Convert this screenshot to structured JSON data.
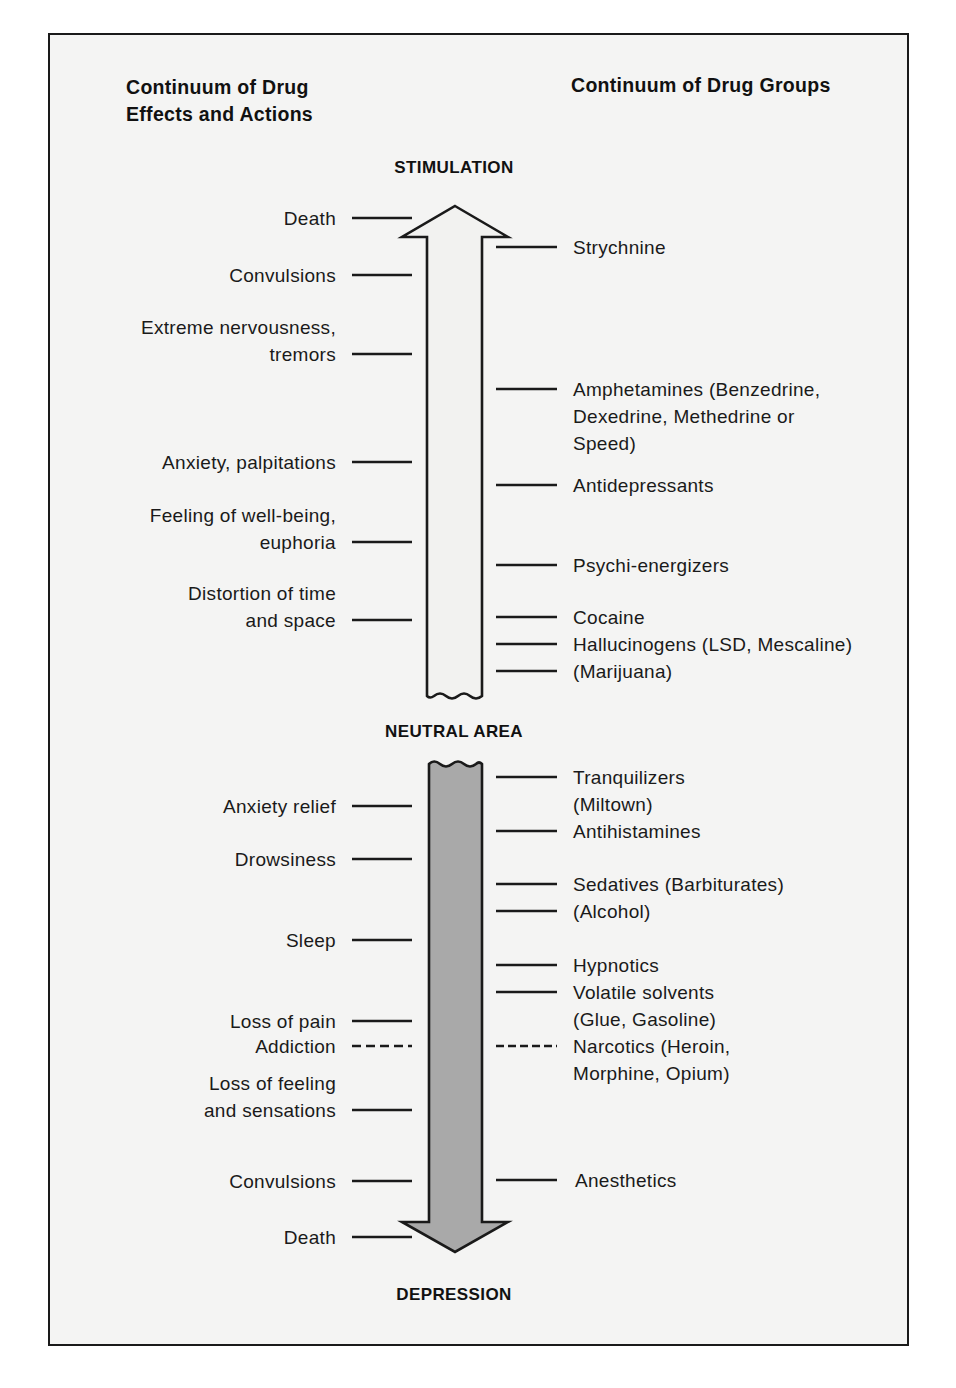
{
  "headers": {
    "left": [
      "Continuum of Drug",
      "Effects and Actions"
    ],
    "right": [
      "Continuum of Drug Groups"
    ]
  },
  "axis_labels": {
    "top": "STIMULATION",
    "middle": "NEUTRAL AREA",
    "bottom": "DEPRESSION"
  },
  "colors": {
    "stimulation_arrow_fill": "#f2f2f0",
    "depression_arrow_fill": "#a9a9a9",
    "outline": "#1a1a1a"
  },
  "effects": [
    {
      "lines": [
        "Death"
      ],
      "style": "solid",
      "zone": "stimulation"
    },
    {
      "lines": [
        "Convulsions"
      ],
      "style": "solid",
      "zone": "stimulation"
    },
    {
      "lines": [
        "Extreme nervousness,",
        "tremors"
      ],
      "style": "solid",
      "zone": "stimulation"
    },
    {
      "lines": [
        "Anxiety, palpitations"
      ],
      "style": "solid",
      "zone": "stimulation"
    },
    {
      "lines": [
        "Feeling of well-being,",
        "euphoria"
      ],
      "style": "solid",
      "zone": "stimulation"
    },
    {
      "lines": [
        "Distortion of time",
        "and space"
      ],
      "style": "solid",
      "zone": "stimulation"
    },
    {
      "lines": [
        "Anxiety relief"
      ],
      "style": "solid",
      "zone": "depression"
    },
    {
      "lines": [
        "Drowsiness"
      ],
      "style": "solid",
      "zone": "depression"
    },
    {
      "lines": [
        "Sleep"
      ],
      "style": "solid",
      "zone": "depression"
    },
    {
      "lines": [
        "Loss of pain"
      ],
      "style": "solid",
      "zone": "depression"
    },
    {
      "lines": [
        "Addiction"
      ],
      "style": "dashed",
      "zone": "depression"
    },
    {
      "lines": [
        "Loss of feeling",
        "and sensations"
      ],
      "style": "solid",
      "zone": "depression"
    },
    {
      "lines": [
        "Convulsions"
      ],
      "style": "solid",
      "zone": "depression"
    },
    {
      "lines": [
        "Death"
      ],
      "style": "solid",
      "zone": "depression"
    }
  ],
  "drug_groups": [
    {
      "lines": [
        "Strychnine"
      ],
      "style": "solid",
      "zone": "stimulation"
    },
    {
      "lines": [
        "Amphetamines (Benzedrine,",
        "Dexedrine, Methedrine or",
        "Speed)"
      ],
      "style": "solid",
      "zone": "stimulation"
    },
    {
      "lines": [
        "Antidepressants"
      ],
      "style": "solid",
      "zone": "stimulation"
    },
    {
      "lines": [
        "Psychi-energizers"
      ],
      "style": "solid",
      "zone": "stimulation"
    },
    {
      "lines": [
        "Cocaine"
      ],
      "style": "solid",
      "zone": "stimulation"
    },
    {
      "lines": [
        "Hallucinogens (LSD, Mescaline)"
      ],
      "style": "solid",
      "zone": "stimulation"
    },
    {
      "lines": [
        "(Marijuana)"
      ],
      "style": "solid",
      "zone": "stimulation"
    },
    {
      "lines": [
        "Tranquilizers",
        "(Miltown)"
      ],
      "style": "solid",
      "zone": "depression"
    },
    {
      "lines": [
        "Antihistamines"
      ],
      "style": "solid",
      "zone": "depression"
    },
    {
      "lines": [
        "Sedatives (Barbiturates)"
      ],
      "style": "solid",
      "zone": "depression"
    },
    {
      "lines": [
        "(Alcohol)"
      ],
      "style": "solid",
      "zone": "depression"
    },
    {
      "lines": [
        "Hypnotics"
      ],
      "style": "solid",
      "zone": "depression"
    },
    {
      "lines": [
        "Volatile solvents",
        "(Glue, Gasoline)"
      ],
      "style": "solid",
      "zone": "depression"
    },
    {
      "lines": [
        "Narcotics (Heroin,",
        "Morphine, Opium)"
      ],
      "style": "dashed",
      "zone": "depression"
    },
    {
      "lines": [
        "Anesthetics"
      ],
      "style": "solid",
      "zone": "depression"
    }
  ]
}
